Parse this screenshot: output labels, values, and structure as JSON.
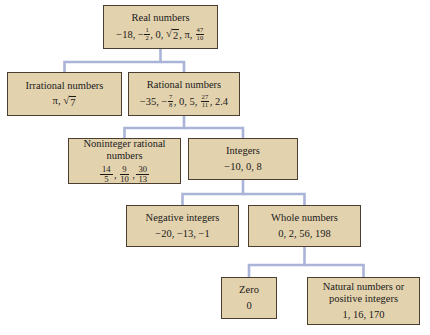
{
  "diagram": {
    "style": {
      "box_fill": "#e3d2ae",
      "box_border": "#4a3e30",
      "connector_color": "#aab4d8",
      "background": "#ffffff",
      "text_color": "#1a1a1a"
    },
    "nodes": [
      {
        "id": "real",
        "label": "Real numbers",
        "examples": "-18, -1/2, 0, √2, π, 47/10",
        "parts": [
          "-18,",
          "-1/2,",
          "0,",
          "√2,",
          "π,",
          "47/10"
        ]
      },
      {
        "id": "irrational",
        "label": "Irrational numbers",
        "examples": "π, √7",
        "parts": [
          "π,",
          "√7"
        ]
      },
      {
        "id": "rational",
        "label": "Rational numbers",
        "examples": "-35, -7/8, 0, 5, 27/11, 2.4",
        "parts": [
          "-35,",
          "-7/8,",
          "0,",
          "5,",
          "27/11,",
          "2.4"
        ]
      },
      {
        "id": "noninteger",
        "label": "Noninteger rational numbers",
        "label_line1": "Noninteger rational",
        "label_line2": "numbers",
        "examples": "14/5, 9/10, 30/13",
        "parts": [
          "14/5,",
          "9/10,",
          "30/13"
        ]
      },
      {
        "id": "integers",
        "label": "Integers",
        "examples": "-10, 0, 8"
      },
      {
        "id": "negative",
        "label": "Negative integers",
        "examples": "-20, -13, -1"
      },
      {
        "id": "whole",
        "label": "Whole numbers",
        "examples": "0, 2, 56, 198"
      },
      {
        "id": "zero",
        "label": "Zero",
        "examples": "0"
      },
      {
        "id": "natural",
        "label": "Natural numbers or positive integers",
        "label_line1": "Natural numbers or",
        "label_line2": "positive integers",
        "examples": "1, 16, 170"
      }
    ],
    "edges": [
      {
        "from": "real",
        "to": "irrational"
      },
      {
        "from": "real",
        "to": "rational"
      },
      {
        "from": "rational",
        "to": "noninteger"
      },
      {
        "from": "rational",
        "to": "integers"
      },
      {
        "from": "integers",
        "to": "negative"
      },
      {
        "from": "integers",
        "to": "whole"
      },
      {
        "from": "whole",
        "to": "zero"
      },
      {
        "from": "whole",
        "to": "natural"
      }
    ],
    "math": {
      "minus": "−",
      "pi": "π",
      "radical": "√",
      "fractions": {
        "one_half": {
          "num": "1",
          "den": "2"
        },
        "fortyseven_tenths": {
          "num": "47",
          "den": "10"
        },
        "seven_eighths": {
          "num": "7",
          "den": "8"
        },
        "twentyseven_elevenths": {
          "num": "27",
          "den": "11"
        },
        "fourteen_fifths": {
          "num": "14",
          "den": "5"
        },
        "nine_tenths": {
          "num": "9",
          "den": "10"
        },
        "thirty_thirteenths": {
          "num": "30",
          "den": "13"
        }
      },
      "radicands": {
        "two": "2",
        "seven": "7"
      },
      "literals": {
        "real_a": "−18,",
        "real_b": ", 0,",
        "real_c": ",",
        "real_d": ",",
        "irr_a": ",",
        "rat_a": "−35,",
        "rat_b": ", 0, 5,",
        "rat_c": ", 2.4",
        "non_sep": ",",
        "integers_examples": "−10, 0, 8",
        "negative_examples": "−20, −13, −1",
        "whole_examples": "0, 2, 56, 198",
        "zero_examples": "0",
        "natural_examples": "1, 16, 170"
      }
    }
  }
}
